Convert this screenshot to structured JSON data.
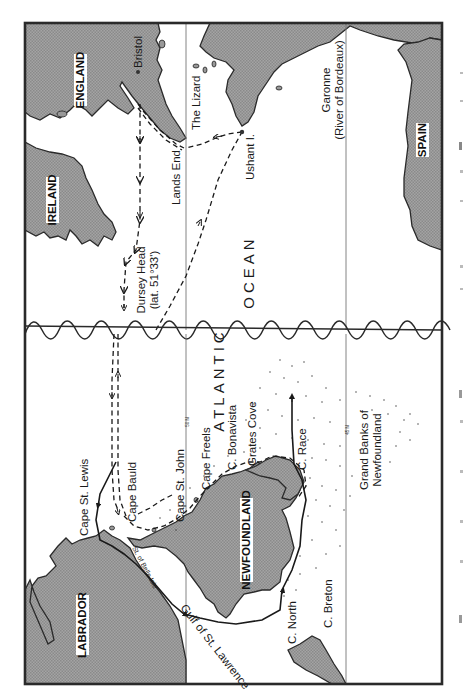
{
  "map": {
    "orientation": "rotated 90 degrees counter-clockwise (north to the left)",
    "frame": {
      "stroke": "#2a2a2a",
      "land_fill": "#9a9a9a",
      "water_fill": "#ffffff"
    },
    "countries": [
      {
        "id": "england",
        "label": "ENGLAND"
      },
      {
        "id": "ireland",
        "label": "IRELAND"
      },
      {
        "id": "spain",
        "label": "SPAIN"
      },
      {
        "id": "labrador",
        "label": "LABRADOR"
      },
      {
        "id": "newfoundland",
        "label": "NEWFOUNDLAND"
      }
    ],
    "places": [
      {
        "id": "bristol",
        "label": "Bristol"
      },
      {
        "id": "the-lizard",
        "label": "The Lizard"
      },
      {
        "id": "lands-end",
        "label": "Lands End"
      },
      {
        "id": "ushant",
        "label": "Ushant I."
      },
      {
        "id": "garonne",
        "label": "Garonne"
      },
      {
        "id": "garonne-sub",
        "label": "(River of Bordeaux)"
      },
      {
        "id": "dursey-head",
        "label": "Dursey Head"
      },
      {
        "id": "dursey-lat",
        "label": "(lat. 51°33')"
      },
      {
        "id": "cape-st-lewis",
        "label": "Cape St. Lewis"
      },
      {
        "id": "cape-bauld",
        "label": "Cape Bauld"
      },
      {
        "id": "cape-st-john",
        "label": "Cape St. John"
      },
      {
        "id": "cape-freels",
        "label": "Cape Freels"
      },
      {
        "id": "c-bonavista",
        "label": "C. Bonavista"
      },
      {
        "id": "grates-cove",
        "label": "Grates Cove"
      },
      {
        "id": "c-race",
        "label": "C. Race"
      },
      {
        "id": "c-north",
        "label": "C. North"
      },
      {
        "id": "c-breton",
        "label": "C. Breton"
      },
      {
        "id": "st-belle-isle",
        "label": "St. of Belle Isle"
      },
      {
        "id": "gulf-st-lawrence",
        "label": "Gulf of St. Lawrence"
      },
      {
        "id": "grand-banks-1",
        "label": "Grand Banks of"
      },
      {
        "id": "grand-banks-2",
        "label": "Newfoundland"
      }
    ],
    "ocean": {
      "word1": "ATLANTIC",
      "word2": "OCEAN"
    },
    "latitude_labels": {
      "lat50": "50 N",
      "lat45": "45 N"
    }
  }
}
